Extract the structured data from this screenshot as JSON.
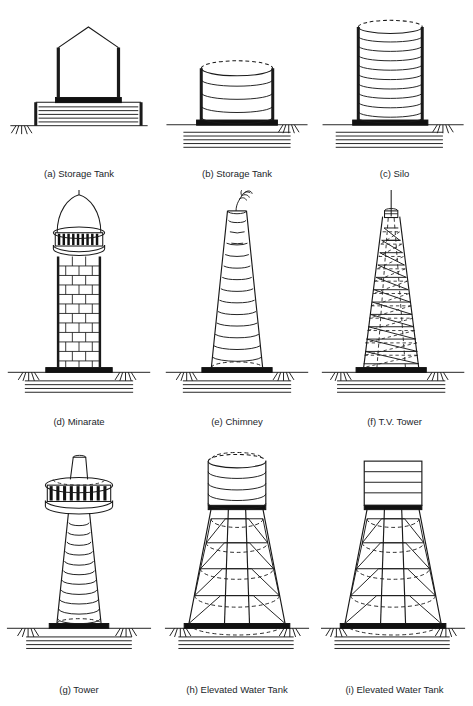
{
  "page": {
    "masthead": "",
    "background_color": "#ffffff",
    "line_color": "#1a1a1a",
    "fill_color": "#ffffff",
    "heavy_color": "#111111"
  },
  "figures": [
    {
      "key": "a",
      "caption": "(a) Storage Tank",
      "subject": "storage-tank-with-pitched-roof-on-raised-foundation",
      "icon": "storage-tank-icon"
    },
    {
      "key": "b",
      "caption": "(b) Storage Tank",
      "subject": "cylindrical-ground-storage-tank",
      "icon": "storage-tank-icon"
    },
    {
      "key": "c",
      "caption": "(c) Silo",
      "subject": "tall-cylindrical-silo",
      "icon": "silo-icon"
    },
    {
      "key": "d",
      "caption": "(d) Minarate",
      "subject": "masonry-minaret-with-dome-and-balcony",
      "icon": "minaret-icon"
    },
    {
      "key": "e",
      "caption": "(e) Chimney",
      "subject": "tapered-industrial-chimney-with-smoke",
      "icon": "chimney-icon"
    },
    {
      "key": "f",
      "caption": "(f) T.V. Tower",
      "subject": "tapered-lattice-television-tower-with-mast",
      "icon": "tv-tower-icon"
    },
    {
      "key": "g",
      "caption": "(g) Tower",
      "subject": "observation-tower-with-deck-and-cabin",
      "icon": "tower-icon"
    },
    {
      "key": "h",
      "caption": "(h) Elevated Water Tank",
      "subject": "circular-elevated-water-tank-on-braced-staging",
      "icon": "elevated-water-tank-icon"
    },
    {
      "key": "i",
      "caption": "(i) Elevated Water Tank",
      "subject": "rectangular-elevated-water-tank-on-braced-staging",
      "icon": "elevated-water-tank-icon"
    }
  ]
}
